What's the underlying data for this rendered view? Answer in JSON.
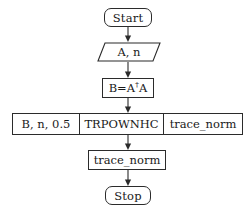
{
  "diagram": {
    "type": "flowchart",
    "orientation": "top-to-bottom",
    "colors": {
      "background": "#ffffff",
      "stroke": "#2b2b2b",
      "text": "#1a1a1a"
    }
  },
  "nodes": {
    "start": {
      "label": "Start",
      "shape": "terminal"
    },
    "input": {
      "label": "A, n",
      "shape": "parallelogram"
    },
    "compute_b": {
      "label_prefix": "B=A",
      "label_superscript": "†",
      "label_suffix": "A",
      "label_full": "B=A†A",
      "shape": "rectangle"
    },
    "subroutine": {
      "shape": "subroutine-row",
      "cells": [
        {
          "label": "B, n, 0.5",
          "role": "inputs"
        },
        {
          "label": "TRPOWNHC",
          "role": "routine-name"
        },
        {
          "label": "trace_norm",
          "role": "outputs"
        }
      ]
    },
    "result": {
      "label": "trace_norm",
      "shape": "rectangle"
    },
    "stop": {
      "label": "Stop",
      "shape": "terminal"
    }
  },
  "connectors": [
    {
      "from": "start",
      "to": "input",
      "style": "arrow-down"
    },
    {
      "from": "input",
      "to": "compute_b",
      "style": "arrow-down"
    },
    {
      "from": "compute_b",
      "to": "subroutine",
      "style": "arrow-down"
    },
    {
      "from": "subroutine",
      "to": "result",
      "style": "arrow-down"
    },
    {
      "from": "result",
      "to": "stop",
      "style": "arrow-down"
    }
  ]
}
